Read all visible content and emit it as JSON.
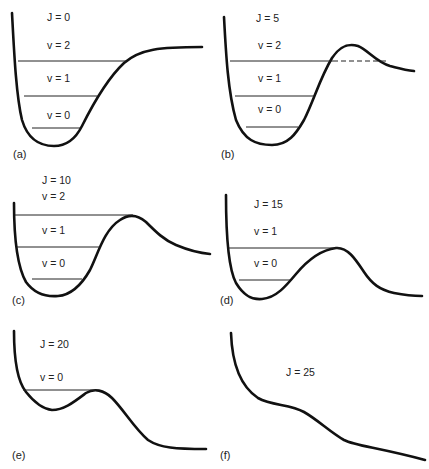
{
  "figure": {
    "panels": [
      {
        "id": "a",
        "panel_label": "(a)",
        "j_label": "J = 0",
        "levels": [
          "v = 2",
          "v = 1",
          "v = 0"
        ],
        "dashed_extension": false
      },
      {
        "id": "b",
        "panel_label": "(b)",
        "j_label": "J = 5",
        "levels": [
          "v = 2",
          "v = 1",
          "v = 0"
        ],
        "dashed_extension": true
      },
      {
        "id": "c",
        "panel_label": "(c)",
        "j_label": "J = 10",
        "levels": [
          "v = 2",
          "v = 1",
          "v = 0"
        ],
        "dashed_extension": false
      },
      {
        "id": "d",
        "panel_label": "(d)",
        "j_label": "J = 15",
        "levels": [
          "v = 1",
          "v = 0"
        ],
        "dashed_extension": false
      },
      {
        "id": "e",
        "panel_label": "(e)",
        "j_label": "J = 20",
        "levels": [
          "v = 0"
        ],
        "dashed_extension": false
      },
      {
        "id": "f",
        "panel_label": "(f)",
        "j_label": "J = 25",
        "levels": [],
        "dashed_extension": false
      }
    ]
  }
}
